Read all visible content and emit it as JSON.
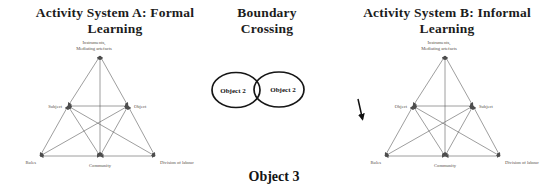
{
  "colors": {
    "background": "#ffffff",
    "ink": "#1c1c1c",
    "diagram_line": "#4d4d4d",
    "small_label": "#565049"
  },
  "system_a": {
    "title_line1": "Activity System A: Formal",
    "title_line2": "Learning",
    "labels": {
      "instruments_line1": "Instruments,",
      "instruments_line2": "Mediating artefacts",
      "subject": "Subject",
      "object": "Object",
      "rules": "Rules",
      "community": "Community",
      "division_of_labour": "Division of labour"
    }
  },
  "boundary": {
    "title_line1": "Boundary",
    "title_line2": "Crossing",
    "left_ellipse_label": "Object 2",
    "right_ellipse_label": "Object 2",
    "shared_object_label": "Object 3"
  },
  "system_b": {
    "title_line1": "Activity System B: Informal",
    "title_line2": "Learning",
    "labels": {
      "instruments_line1": "Instruments,",
      "instruments_line2": "Mediating artefacts",
      "object": "Object",
      "subject": "Subject",
      "rules": "Rules",
      "community": "Community",
      "division_of_labour": "Division of labour"
    },
    "annotation": "down-arrow"
  }
}
